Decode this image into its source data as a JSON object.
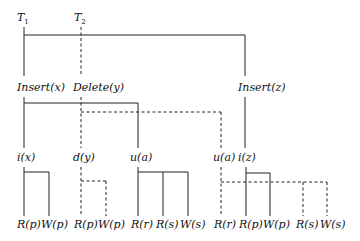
{
  "diagram": {
    "type": "transaction-tree",
    "roots": [
      {
        "label": "T",
        "subscript": "1",
        "style": "solid"
      },
      {
        "label": "T",
        "subscript": "2",
        "style": "dashed"
      }
    ],
    "level1": {
      "insert_x": "Insert(x)",
      "delete_y": "Delete(y)",
      "insert_z": "Insert(z)"
    },
    "level2": {
      "i_x": "i(x)",
      "d_y": "d(y)",
      "u_a_1": "u(a)",
      "u_a_2": "u(a)",
      "i_z": "i(z)"
    },
    "leaves": [
      {
        "label": "R(p)",
        "parent": "i(x)",
        "style": "solid"
      },
      {
        "label": "W(p)",
        "parent": "i(x)",
        "style": "solid"
      },
      {
        "label": "R(p)",
        "parent": "d(y)",
        "style": "dashed"
      },
      {
        "label": "W(p)",
        "parent": "d(y)",
        "style": "dashed"
      },
      {
        "label": "R(r)",
        "parent": "u(a)",
        "style": "solid"
      },
      {
        "label": "R(s)",
        "parent": "u(a)",
        "style": "solid"
      },
      {
        "label": "W(s)",
        "parent": "u(a)",
        "style": "solid"
      },
      {
        "label": "R(r)",
        "parent": "u(a)",
        "style": "dashed"
      },
      {
        "label": "R(p)",
        "parent": "i(z)",
        "style": "solid"
      },
      {
        "label": "W(p)",
        "parent": "i(z)",
        "style": "solid"
      },
      {
        "label": "R(s)",
        "parent": "u(a)",
        "style": "dashed"
      },
      {
        "label": "W(s)",
        "parent": "u(a)",
        "style": "dashed"
      }
    ]
  }
}
